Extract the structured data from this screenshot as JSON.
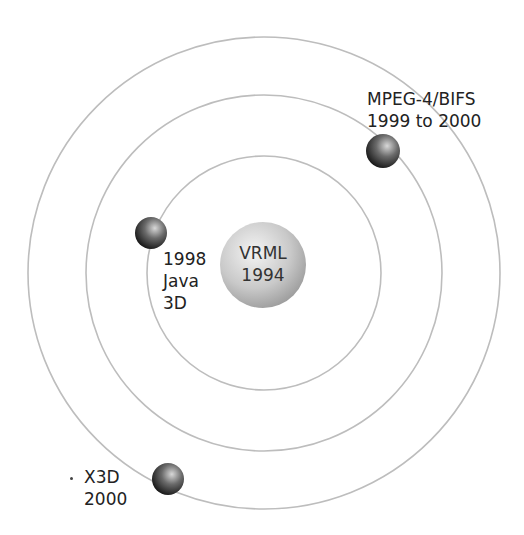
{
  "diagram": {
    "type": "orbit",
    "center": {
      "x": 264,
      "y": 273
    },
    "rings": [
      {
        "name": "inner",
        "radius": 117
      },
      {
        "name": "middle",
        "radius": 178
      },
      {
        "name": "outer",
        "radius": 236
      }
    ],
    "ring_color": "#b8b8b8",
    "core": {
      "line1": "VRML",
      "line2": "1994",
      "radius": 43
    },
    "planets": [
      {
        "id": "java3d",
        "lines": [
          "1998",
          "Java",
          "3D"
        ],
        "x": 151,
        "y": 233
      },
      {
        "id": "mpeg4",
        "lines": [
          "MPEG-4/BIFS",
          "1999 to 2000"
        ],
        "x": 383,
        "y": 151
      },
      {
        "id": "x3d",
        "lines": [
          "X3D",
          "2000"
        ],
        "x": 168,
        "y": 479
      }
    ]
  }
}
